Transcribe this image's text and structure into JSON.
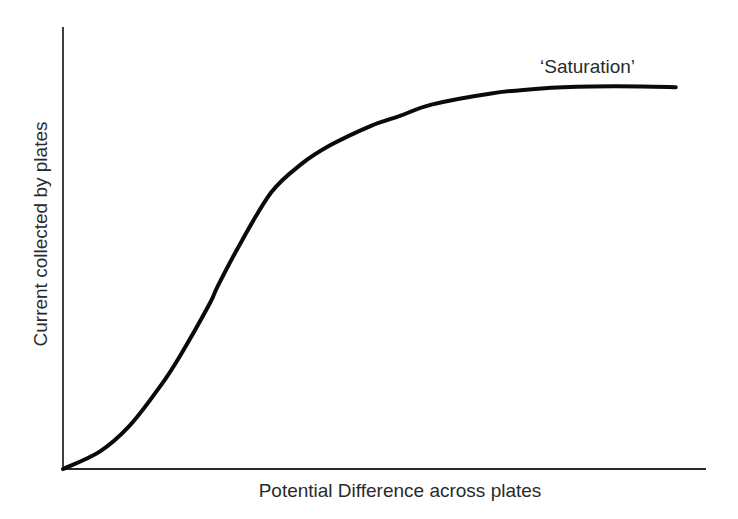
{
  "chart_data": {
    "type": "line",
    "title": "",
    "xlabel": "Potential Difference across plates",
    "ylabel": "Current collected by plates",
    "annotations": [
      {
        "text": "‘Saturation’",
        "position": "above end of curve (plateau)"
      }
    ],
    "grid": false,
    "legend": null,
    "x_ticks": [],
    "y_ticks": [],
    "xlim": [
      0,
      1
    ],
    "ylim": [
      0,
      1
    ],
    "note": "Qualitative sketch; no numeric scale shown. Values normalized 0-1 (x across axis length, y up axis height).",
    "series": [
      {
        "name": "Current vs Potential Difference",
        "x": [
          0.0,
          0.057,
          0.104,
          0.152,
          0.182,
          0.228,
          0.241,
          0.278,
          0.324,
          0.37,
          0.416,
          0.479,
          0.523,
          0.573,
          0.666,
          0.744,
          0.822,
          0.9,
          0.953
        ],
        "y": [
          0.0,
          0.045,
          0.113,
          0.216,
          0.293,
          0.428,
          0.475,
          0.591,
          0.717,
          0.789,
          0.839,
          0.889,
          0.914,
          0.944,
          0.973,
          0.986,
          0.991,
          0.991,
          0.989
        ]
      }
    ]
  },
  "axes": {
    "origin_px": [
      63,
      469
    ],
    "y_top_px": 27,
    "x_end_px": 706
  },
  "labels": {
    "xlabel": "Potential Difference across plates",
    "ylabel": "Current collected by plates",
    "annotation": "‘Saturation’"
  },
  "colors": {
    "curve": "#0a0a0a",
    "axes": "#2a2a2a",
    "text": "#2a2a2a",
    "background": "#ffffff"
  }
}
